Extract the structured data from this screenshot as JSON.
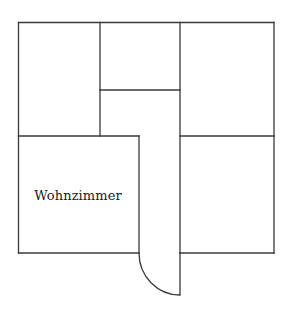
{
  "diagram": {
    "type": "floor-plan",
    "rooms": [
      {
        "id": "room-top-left",
        "label": ""
      },
      {
        "id": "room-top-middle",
        "label": ""
      },
      {
        "id": "hallway",
        "label": ""
      },
      {
        "id": "room-top-right",
        "label": ""
      },
      {
        "id": "living-room",
        "label": "Wohnzimmer"
      },
      {
        "id": "room-bottom-right",
        "label": ""
      }
    ],
    "door": {
      "id": "entrance-door",
      "swing": "quarter-arc"
    },
    "colors": {
      "line": "#3a3a3a",
      "background": "#ffffff",
      "text": "#1a1a1a"
    }
  }
}
